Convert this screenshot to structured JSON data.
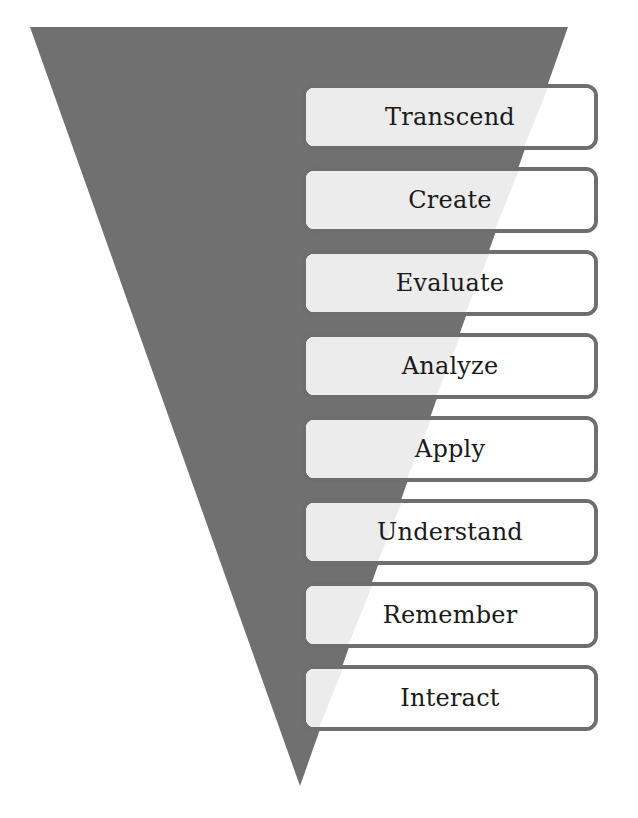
{
  "diagram": {
    "type": "inverted-pyramid",
    "colors": {
      "funnel": "#707070",
      "box_border": "#6e6e6e",
      "box_fill_inside": "#ececec",
      "box_fill_outside": "#ffffff",
      "text": "#1a1a1a"
    },
    "levels": [
      {
        "label": "Transcend"
      },
      {
        "label": "Create"
      },
      {
        "label": "Evaluate"
      },
      {
        "label": "Analyze"
      },
      {
        "label": "Apply"
      },
      {
        "label": "Understand"
      },
      {
        "label": "Remember"
      },
      {
        "label": "Interact"
      }
    ]
  }
}
